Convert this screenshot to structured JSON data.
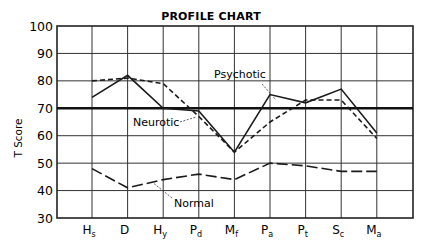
{
  "chart_data": {
    "type": "line",
    "title": "PROFILE CHART",
    "xlabel": "",
    "ylabel": "T Score",
    "ylim": [
      30,
      100
    ],
    "yticks": [
      30,
      40,
      50,
      60,
      70,
      80,
      90,
      100
    ],
    "grid": true,
    "reference_line": 70,
    "categories": [
      "Hs",
      "D",
      "Hy",
      "Pd",
      "Mf",
      "Pa",
      "Pt",
      "Sc",
      "Ma"
    ],
    "category_labels": [
      {
        "main": "H",
        "sub": "s"
      },
      {
        "main": "D",
        "sub": ""
      },
      {
        "main": "H",
        "sub": "y"
      },
      {
        "main": "P",
        "sub": "d"
      },
      {
        "main": "M",
        "sub": "f"
      },
      {
        "main": "P",
        "sub": "a"
      },
      {
        "main": "P",
        "sub": "t"
      },
      {
        "main": "S",
        "sub": "c"
      },
      {
        "main": "M",
        "sub": "a"
      }
    ],
    "series": [
      {
        "name": "Psychotic",
        "style": "solid",
        "values": [
          74,
          82,
          70,
          69,
          54,
          75,
          72,
          77,
          61
        ]
      },
      {
        "name": "Neurotic",
        "style": "dashed",
        "values": [
          80,
          81,
          79,
          67,
          54,
          65,
          73,
          73,
          59
        ]
      },
      {
        "name": "Normal",
        "style": "long-dashed",
        "values": [
          48,
          41,
          44,
          46,
          44,
          50,
          49,
          47,
          47
        ]
      }
    ],
    "annotations": [
      {
        "text": "Psychotic",
        "series": "Psychotic"
      },
      {
        "text": "Neurotic",
        "series": "Neurotic"
      },
      {
        "text": "Normal",
        "series": "Normal"
      }
    ],
    "legend": "none (inline annotations)"
  }
}
